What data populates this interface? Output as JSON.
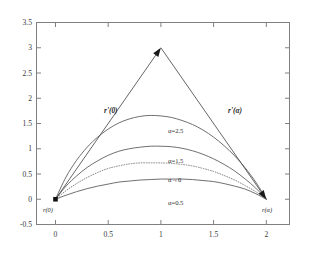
{
  "chart_data": {
    "type": "line",
    "title": "",
    "xlabel": "",
    "ylabel": "",
    "xlim": [
      -0.18,
      2.22
    ],
    "ylim": [
      -0.5,
      3.5
    ],
    "grid": false,
    "legend_position": "inline-annotations",
    "x_ticks": [
      "0",
      "0.5",
      "1",
      "1.5",
      "2"
    ],
    "x_tick_values": [
      0,
      0.5,
      1,
      1.5,
      2
    ],
    "y_ticks": [
      "-0.5",
      "0",
      "0.5",
      "1",
      "1.5",
      "2",
      "2.5",
      "3",
      "3.5"
    ],
    "y_tick_values": [
      -0.5,
      0,
      0.5,
      1,
      1.5,
      2,
      2.5,
      3,
      3.5
    ],
    "series": [
      {
        "name": "alpha=2.5",
        "label": "α=2.5",
        "style": "solid",
        "color": "#555555",
        "peak_x": 1.0,
        "peak_y": 1.65,
        "x": [
          0,
          0.1,
          0.2,
          0.3,
          0.4,
          0.5,
          0.6,
          0.7,
          0.8,
          0.9,
          1.0,
          1.1,
          1.2,
          1.3,
          1.4,
          1.5,
          1.6,
          1.7,
          1.8,
          1.9,
          2.0
        ],
        "values": [
          0,
          0.44,
          0.77,
          1.03,
          1.23,
          1.39,
          1.51,
          1.59,
          1.64,
          1.66,
          1.65,
          1.62,
          1.56,
          1.48,
          1.37,
          1.23,
          1.06,
          0.86,
          0.62,
          0.34,
          0
        ]
      },
      {
        "name": "alpha=1.5",
        "label": "α=1.5",
        "style": "solid",
        "color": "#555555",
        "peak_x": 1.05,
        "peak_y": 1.05,
        "x": [
          0,
          0.1,
          0.2,
          0.3,
          0.4,
          0.5,
          0.6,
          0.7,
          0.8,
          0.9,
          1.0,
          1.1,
          1.2,
          1.3,
          1.4,
          1.5,
          1.6,
          1.7,
          1.8,
          1.9,
          2.0
        ],
        "values": [
          0,
          0.26,
          0.46,
          0.63,
          0.76,
          0.87,
          0.95,
          1.0,
          1.03,
          1.05,
          1.05,
          1.04,
          1.01,
          0.96,
          0.89,
          0.8,
          0.69,
          0.56,
          0.4,
          0.22,
          0
        ]
      },
      {
        "name": "alpha->0",
        "label": "α→0",
        "style": "dotted",
        "color": "#777777",
        "peak_x": 1.0,
        "peak_y": 0.72,
        "x": [
          0,
          0.1,
          0.2,
          0.3,
          0.4,
          0.5,
          0.6,
          0.7,
          0.8,
          0.9,
          1.0,
          1.1,
          1.2,
          1.3,
          1.4,
          1.5,
          1.6,
          1.7,
          1.8,
          1.9,
          2.0
        ],
        "values": [
          0,
          0.17,
          0.31,
          0.43,
          0.53,
          0.61,
          0.66,
          0.7,
          0.72,
          0.72,
          0.72,
          0.71,
          0.69,
          0.66,
          0.61,
          0.55,
          0.47,
          0.38,
          0.27,
          0.15,
          0
        ]
      },
      {
        "name": "alpha=0.5",
        "label": "α=0.5",
        "style": "solid",
        "color": "#555555",
        "peak_x": 1.15,
        "peak_y": 0.4,
        "x": [
          0,
          0.1,
          0.2,
          0.3,
          0.4,
          0.5,
          0.6,
          0.7,
          0.8,
          0.9,
          1.0,
          1.1,
          1.2,
          1.3,
          1.4,
          1.5,
          1.6,
          1.7,
          1.8,
          1.9,
          2.0
        ],
        "values": [
          0,
          0.08,
          0.15,
          0.21,
          0.26,
          0.3,
          0.34,
          0.36,
          0.38,
          0.39,
          0.4,
          0.4,
          0.4,
          0.39,
          0.37,
          0.35,
          0.31,
          0.26,
          0.2,
          0.11,
          0
        ]
      }
    ],
    "vectors": [
      {
        "name": "r-prime-0",
        "label": "r'(0)",
        "from": [
          0,
          0
        ],
        "to": [
          1.0,
          3.0
        ],
        "arrow": "end"
      },
      {
        "name": "r-prime-alpha",
        "label": "r'(α)",
        "from": [
          1.0,
          3.0
        ],
        "to": [
          2.0,
          0
        ],
        "arrow": "end"
      }
    ],
    "annotations": [
      {
        "name": "r-0",
        "label": "r(0)",
        "x": 0,
        "y": 0,
        "marker": "filled-square"
      },
      {
        "name": "r-alpha",
        "label": "r(α)",
        "x": 2,
        "y": 0,
        "marker": "arrowhead"
      }
    ]
  },
  "axes": {
    "frame_color": "#808080",
    "x_tick_labels": [
      "0",
      "0.5",
      "1",
      "1.5",
      "2"
    ],
    "y_tick_labels": [
      "3.5",
      "3",
      "2.5",
      "2",
      "1.5",
      "1",
      "0.5",
      "0",
      "-0.5"
    ]
  },
  "labels": {
    "alpha_25": "α=2.5",
    "alpha_15": "α=1.5",
    "alpha_0": "α→0",
    "alpha_05": "α=0.5",
    "r_prime_0": "r'(0)",
    "r_prime_alpha": "r'(α)",
    "r_0": "r(0)",
    "r_alpha": "r(α)"
  }
}
